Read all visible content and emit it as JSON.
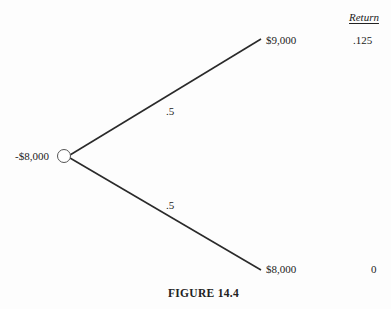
{
  "figure": {
    "caption": "FIGURE 14.4",
    "column_header": "Return"
  },
  "tree": {
    "root": {
      "value": "-$8,000",
      "shape": "circle"
    },
    "branches": [
      {
        "probability": ".5",
        "outcome": "$9,000",
        "return": ".125"
      },
      {
        "probability": ".5",
        "outcome": "$8,000",
        "return": "0"
      }
    ]
  },
  "colors": {
    "line": "#2a2a2a",
    "node_stroke": "#555555",
    "text": "#222222",
    "background": "#fdfdfd"
  }
}
